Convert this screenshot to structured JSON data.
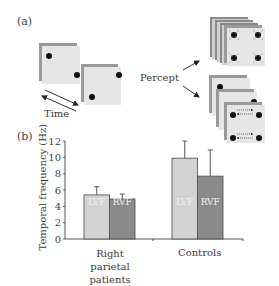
{
  "panel_a": {
    "label": "(a)",
    "time_label": "Time",
    "percept_label": "Percept"
  },
  "panel_b": {
    "label": "(b)"
  },
  "colors": {
    "lvf": "#d2d2d2",
    "rvf": "#8a8a8a",
    "frame": "#e6e6e6",
    "axis": "#555555"
  },
  "chart_data": {
    "type": "bar",
    "title": "",
    "xlabel": "",
    "ylabel": "Temporal frequency (Hz)",
    "ylim": [
      0,
      12
    ],
    "yticks": [
      0,
      2,
      4,
      6,
      8,
      10,
      12
    ],
    "categories": [
      "Right parietal patients",
      "Controls"
    ],
    "series": [
      {
        "name": "LVF",
        "values": [
          5.4,
          9.9
        ],
        "error_upper": [
          6.4,
          12.0
        ]
      },
      {
        "name": "RVF",
        "values": [
          4.9,
          7.7
        ],
        "error_upper": [
          5.5,
          10.9
        ]
      }
    ],
    "bar_labels_inside": true,
    "grid": false,
    "legend": "none (labels inside bars)"
  }
}
